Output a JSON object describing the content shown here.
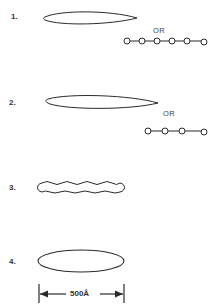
{
  "figure": {
    "items": [
      {
        "number": "1.",
        "shape": "elongated lens (rod)",
        "alternative_label": "OR",
        "alternative": "bead chain",
        "beads": 6
      },
      {
        "number": "2.",
        "shape": "elongated lens (rod)",
        "alternative_label": "OR",
        "alternative": "bead chain",
        "beads": 4
      },
      {
        "number": "3.",
        "shape": "wavy / helical rod"
      },
      {
        "number": "4.",
        "shape": "ellipsoid"
      }
    ],
    "scale_bar": {
      "label": "500Å"
    },
    "colors": {
      "stroke": "#2a2a2a",
      "background": "#ffffff"
    }
  }
}
